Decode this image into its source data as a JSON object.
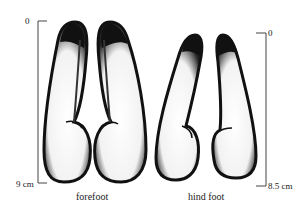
{
  "figure": {
    "forefoot": {
      "caption": "forefoot",
      "scale_top": "0",
      "scale_bottom": "9 cm"
    },
    "hindfoot": {
      "caption": "hind foot",
      "scale_top": "0",
      "scale_bottom": "8.5 cm"
    }
  }
}
